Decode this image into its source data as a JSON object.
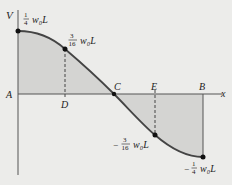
{
  "diagram": {
    "type": "shear-force-diagram",
    "axis_labels": {
      "vertical": "V",
      "horizontal": "x"
    },
    "points": {
      "A": "A",
      "D": "D",
      "C": "C",
      "E": "E",
      "B": "B"
    },
    "values": {
      "top": {
        "num": "1",
        "den": "4",
        "sign": "",
        "suffix": "w₀L"
      },
      "d_value": {
        "num": "3",
        "den": "16",
        "sign": "",
        "suffix": "w₀L"
      },
      "e_value": {
        "num": "3",
        "den": "16",
        "sign": "−",
        "suffix": "w₀L"
      },
      "bottom": {
        "num": "1",
        "den": "4",
        "sign": "−",
        "suffix": "w₀L"
      }
    },
    "colors": {
      "background": "#ececea",
      "fill": "#d4d4d2",
      "curve": "#444444",
      "axis": "#555555"
    }
  }
}
